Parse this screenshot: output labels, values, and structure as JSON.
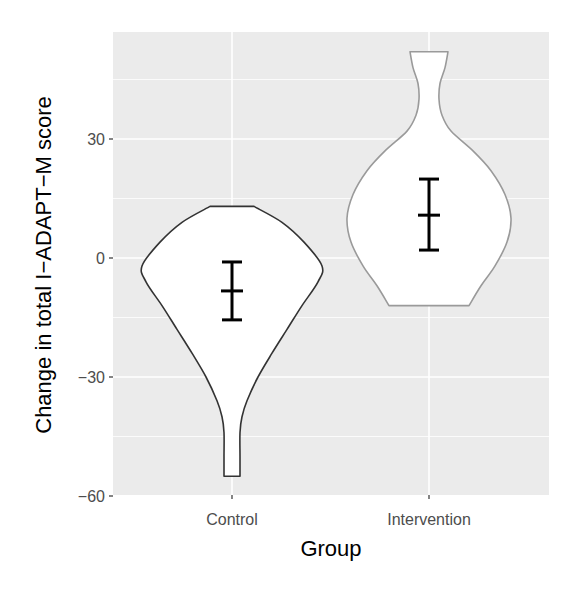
{
  "chart_data": {
    "type": "violin",
    "title": "",
    "xlabel": "Group",
    "ylabel": "Change in total I−ADAPT−M score",
    "categories": [
      "Control",
      "Intervention"
    ],
    "ylim": [
      -62,
      58
    ],
    "yticks": [
      -60,
      -30,
      0,
      30
    ],
    "ytick_labels": [
      "−60",
      "−30",
      "0",
      "30"
    ],
    "grid": true,
    "legend": null,
    "series": [
      {
        "name": "Control",
        "outline_color": "#333333",
        "fill_color": "#ffffff",
        "violin_range": [
          -55,
          13
        ],
        "mean": -8.3,
        "error_bar": [
          -15.6,
          -1.0
        ],
        "profile": [
          {
            "y": 13,
            "half_width": 22
          },
          {
            "y": 9,
            "half_width": 50
          },
          {
            "y": 4,
            "half_width": 72
          },
          {
            "y": -2,
            "half_width": 90
          },
          {
            "y": -6,
            "half_width": 86
          },
          {
            "y": -12,
            "half_width": 70
          },
          {
            "y": -18,
            "half_width": 55
          },
          {
            "y": -24,
            "half_width": 40
          },
          {
            "y": -30,
            "half_width": 26
          },
          {
            "y": -36,
            "half_width": 15
          },
          {
            "y": -40,
            "half_width": 10
          },
          {
            "y": -44,
            "half_width": 8
          },
          {
            "y": -50,
            "half_width": 8
          },
          {
            "y": -55,
            "half_width": 8
          }
        ]
      },
      {
        "name": "Intervention",
        "outline_color": "#9a9a9a",
        "fill_color": "#ffffff",
        "violin_range": [
          -12,
          52
        ],
        "mean": 10.8,
        "error_bar": [
          2.0,
          19.9
        ],
        "profile": [
          {
            "y": 52,
            "half_width": 19
          },
          {
            "y": 48,
            "half_width": 16
          },
          {
            "y": 44,
            "half_width": 11
          },
          {
            "y": 40,
            "half_width": 10
          },
          {
            "y": 36,
            "half_width": 13
          },
          {
            "y": 32,
            "half_width": 22
          },
          {
            "y": 27,
            "half_width": 44
          },
          {
            "y": 22,
            "half_width": 62
          },
          {
            "y": 16,
            "half_width": 76
          },
          {
            "y": 10,
            "half_width": 82
          },
          {
            "y": 4,
            "half_width": 78
          },
          {
            "y": -2,
            "half_width": 66
          },
          {
            "y": -7,
            "half_width": 52
          },
          {
            "y": -12,
            "half_width": 40
          }
        ]
      }
    ]
  }
}
